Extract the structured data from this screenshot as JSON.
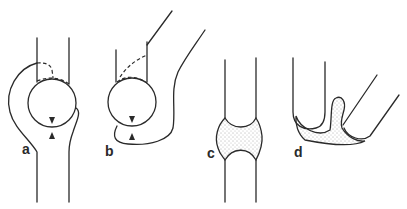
{
  "figure": {
    "panels": [
      {
        "id": "a",
        "label": "a"
      },
      {
        "id": "b",
        "label": "b"
      },
      {
        "id": "c",
        "label": "c"
      },
      {
        "id": "d",
        "label": "d"
      }
    ],
    "colors": {
      "stroke": "#2a2a2a",
      "background": "#ffffff",
      "stipple": "#555555"
    }
  }
}
